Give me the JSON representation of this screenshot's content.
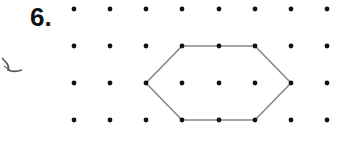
{
  "problem": {
    "number_label": "6."
  },
  "grid": {
    "columns_x": [
      74,
      110,
      146,
      182,
      219,
      255,
      291,
      327
    ],
    "rows_y": [
      9,
      46,
      83,
      120
    ],
    "dot_color": "#111111",
    "dot_radius": 2.4
  },
  "shape": {
    "type": "hexagon",
    "stroke_color": "#888888",
    "vertices": [
      [
        182,
        46
      ],
      [
        255,
        46
      ],
      [
        291,
        83
      ],
      [
        255,
        120
      ],
      [
        182,
        120
      ],
      [
        146,
        83
      ]
    ]
  },
  "marks": {
    "scribble_color": "#555555"
  }
}
